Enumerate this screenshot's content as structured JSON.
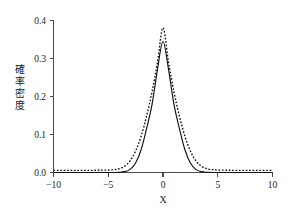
{
  "chart_data": {
    "type": "line",
    "title": "",
    "xlabel": "X",
    "ylabel": "確率密度",
    "ylabel_chars": [
      "確",
      "率",
      "密",
      "度"
    ],
    "xlim": [
      -10,
      10
    ],
    "ylim": [
      0.0,
      0.42
    ],
    "grid": false,
    "legend": "none",
    "xticks": [
      -10,
      -5,
      0,
      5,
      10
    ],
    "xtick_labels": [
      "−10",
      "−5",
      "0",
      "5",
      "10"
    ],
    "yticks": [
      0.0,
      0.1,
      0.2,
      0.3,
      0.4
    ],
    "ytick_labels": [
      "0.0",
      "0.1",
      "0.2",
      "0.3",
      "0.4"
    ],
    "x": [
      -10,
      -9.5,
      -9,
      -8.5,
      -8,
      -7.5,
      -7,
      -6.5,
      -6,
      -5.5,
      -5,
      -4.5,
      -4,
      -3.5,
      -3,
      -2.5,
      -2,
      -1.5,
      -1,
      -0.5,
      0,
      0.5,
      1,
      1.5,
      2,
      2.5,
      3,
      3.5,
      4,
      4.5,
      5,
      5.5,
      6,
      6.5,
      7,
      7.5,
      8,
      8.5,
      9,
      9.5,
      10
    ],
    "series": [
      {
        "name": "solid-curve",
        "style": "solid",
        "color": "#111111",
        "peak_x": 0,
        "peak_y": 0.362,
        "values": [
          0.0,
          0.0,
          0.0,
          0.0,
          0.0,
          0.0,
          0.0,
          0.0,
          0.0,
          0.0,
          0.0,
          0.0,
          0.0005,
          0.0023,
          0.0087,
          0.0261,
          0.0629,
          0.1215,
          0.1883,
          0.2859,
          0.362,
          0.2859,
          0.1883,
          0.1215,
          0.0629,
          0.0261,
          0.0087,
          0.0023,
          0.0005,
          0.0,
          0.0,
          0.0,
          0.0,
          0.0,
          0.0,
          0.0,
          0.0,
          0.0,
          0.0,
          0.0,
          0.0
        ]
      },
      {
        "name": "dotted-curve",
        "style": "dotted",
        "color": "#111111",
        "peak_x": 0,
        "peak_y": 0.4,
        "values": [
          0.006,
          0.006,
          0.006,
          0.006,
          0.006,
          0.006,
          0.006,
          0.006,
          0.0062,
          0.0065,
          0.007,
          0.008,
          0.0105,
          0.0175,
          0.0325,
          0.0595,
          0.1,
          0.1555,
          0.223,
          0.305,
          0.4,
          0.305,
          0.223,
          0.1555,
          0.1,
          0.0595,
          0.0325,
          0.0175,
          0.0105,
          0.008,
          0.007,
          0.0065,
          0.0062,
          0.006,
          0.006,
          0.006,
          0.006,
          0.006,
          0.006,
          0.006,
          0.006
        ]
      }
    ]
  },
  "figure": {
    "background_color": "#ffffff",
    "axis_color": "#4a4a4a"
  }
}
